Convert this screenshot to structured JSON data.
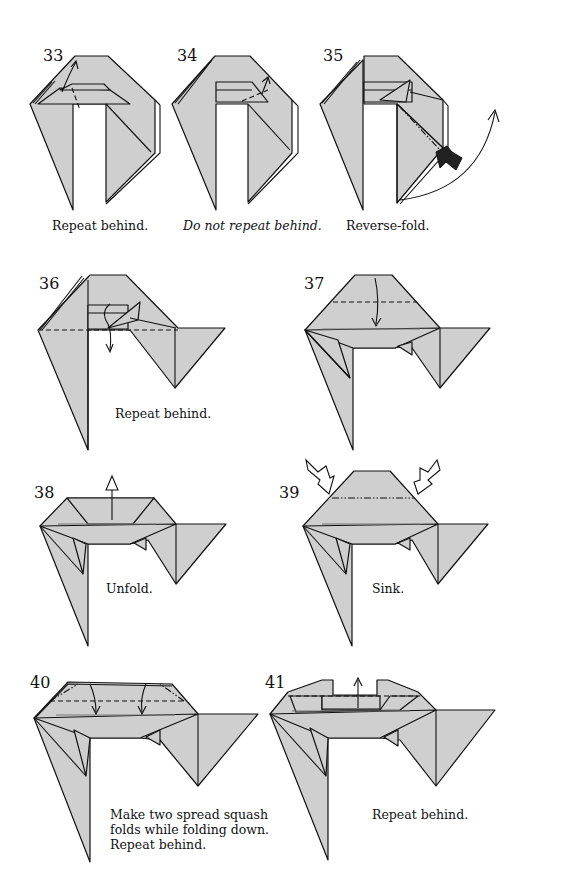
{
  "page": {
    "background": "#ffffff",
    "paper_color": "#cfcfcf",
    "line_color": "#111111"
  },
  "steps": [
    {
      "number": "33",
      "caption": "Repeat behind.",
      "caption_style": "normal"
    },
    {
      "number": "34",
      "caption": "Do not repeat behind.",
      "caption_style": "italic"
    },
    {
      "number": "35",
      "caption": "Reverse-fold.",
      "caption_style": "normal"
    },
    {
      "number": "36",
      "caption": "Repeat behind.",
      "caption_style": "normal"
    },
    {
      "number": "37",
      "caption": "",
      "caption_style": "normal"
    },
    {
      "number": "38",
      "caption": "Unfold.",
      "caption_style": "normal"
    },
    {
      "number": "39",
      "caption": "Sink.",
      "caption_style": "normal"
    },
    {
      "number": "40",
      "caption_lines": [
        "Make two spread squash",
        "folds while folding down.",
        "Repeat behind."
      ],
      "caption_style": "normal"
    },
    {
      "number": "41",
      "caption": "Repeat behind.",
      "caption_style": "normal"
    }
  ],
  "symbols": {
    "valley_fold": "dashed-line",
    "mountain_fold": "dash-dot-line",
    "fold_arrow": "curved-arrow",
    "unfold_arrow": "hollow-arrow",
    "sink_arrow": "hollow-push-arrow",
    "reverse_fold_arrow": "black-push-arrow"
  }
}
